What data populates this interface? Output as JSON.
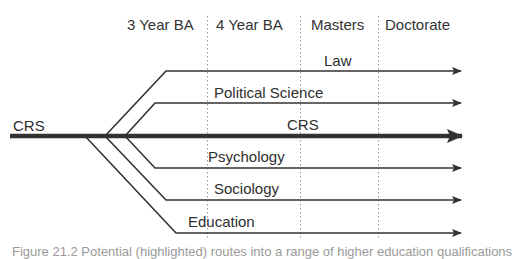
{
  "header": {
    "columns": [
      "3 Year BA",
      "4 Year BA",
      "Masters",
      "Doctorate"
    ]
  },
  "routes": {
    "start_label": "CRS",
    "main": {
      "label": "CRS"
    },
    "branches": [
      {
        "label": "Law"
      },
      {
        "label": "Political Science"
      },
      {
        "label": "Psychology"
      },
      {
        "label": "Sociology"
      },
      {
        "label": "Education"
      }
    ]
  },
  "caption": "Figure 21.2 Potential (highlighted) routes into a range of higher education qualifications",
  "colors": {
    "line": "#333333",
    "divider": "#9a9a9a",
    "text": "#2e2e2e"
  }
}
